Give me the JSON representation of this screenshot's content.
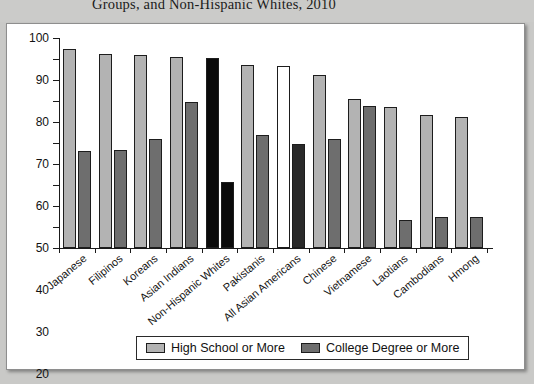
{
  "caption": {
    "text": "Groups, and Non-Hispanic Whites, 2010"
  },
  "legend": {
    "items": [
      {
        "label": "High School or More",
        "swatch": "#b3b3b3"
      },
      {
        "label": "College Degree or More",
        "swatch": "#6e6e6e"
      }
    ]
  },
  "colors": {
    "high_school": "#b3b3b3",
    "college": "#6e6e6e",
    "highlight_black": "#0a0a0a",
    "highlight_white": "#ffffff",
    "highlight_nearblack": "#2a2a2a",
    "axis": "#1a1a1a",
    "panel_background": "#ffffff",
    "page_background": "#c9c9c7"
  },
  "chart_data": {
    "type": "bar",
    "title": "Groups, and Non-Hispanic Whites, 2010",
    "xlabel": "",
    "ylabel": "",
    "ylim": [
      0,
      100
    ],
    "yticks": [
      0,
      10,
      20,
      30,
      40,
      50,
      60,
      70,
      80,
      90,
      100
    ],
    "grid": false,
    "legend_position": "bottom",
    "categories": [
      "Japanese",
      "Filipinos",
      "Koreans",
      "Asian Indians",
      "Non-Hispanic Whites",
      "Pakistanis",
      "All Asian Americans",
      "Chinese",
      "Vietnamese",
      "Laotians",
      "Cambodians",
      "Hmong"
    ],
    "series": [
      {
        "name": "High School or More",
        "values": [
          95,
          92.5,
          92,
          91,
          90.5,
          87,
          86.5,
          82.5,
          71,
          67,
          63.5,
          62.5
        ],
        "styles": [
          "gray",
          "gray",
          "gray",
          "gray",
          "black",
          "gray",
          "white",
          "gray",
          "gray",
          "gray",
          "gray",
          "gray"
        ]
      },
      {
        "name": "College Degree or More",
        "values": [
          46,
          46.5,
          52,
          69.5,
          31.5,
          54,
          49.5,
          52,
          67.5,
          13.5,
          15,
          15
        ],
        "styles": [
          "dark",
          "dark",
          "dark",
          "dark",
          "black",
          "dark",
          "nearblack",
          "dark",
          "dark",
          "dark",
          "dark",
          "dark"
        ]
      }
    ]
  }
}
